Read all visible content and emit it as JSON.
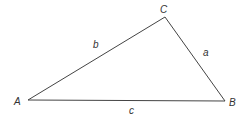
{
  "diagram": {
    "type": "triangle",
    "stroke_color": "#444444",
    "vertices": [
      {
        "label": "A",
        "x": 28,
        "y": 100
      },
      {
        "label": "B",
        "x": 225,
        "y": 101
      },
      {
        "label": "C",
        "x": 165,
        "y": 17
      }
    ],
    "sides": [
      {
        "label": "a",
        "between": "B-C"
      },
      {
        "label": "b",
        "between": "A-C"
      },
      {
        "label": "c",
        "between": "A-B"
      }
    ]
  }
}
